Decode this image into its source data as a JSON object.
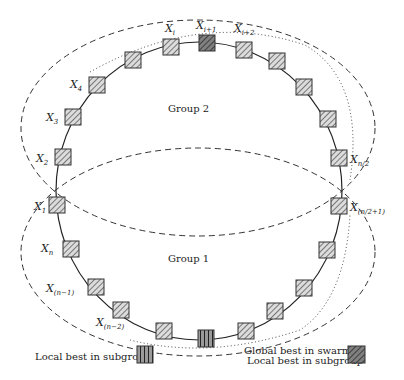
{
  "diagram": {
    "type": "ring-topology-swarm",
    "groups": [
      {
        "id": "group-2",
        "label": "Group 2"
      },
      {
        "id": "group-1",
        "label": "Group 1"
      }
    ],
    "node_labels": {
      "x_i": {
        "base": "X",
        "sub": "i"
      },
      "x_i1": {
        "base": "X",
        "sub": "i+1"
      },
      "x_i2": {
        "base": "X",
        "sub": "i+2"
      },
      "x_4": {
        "base": "X",
        "sub": "4"
      },
      "x_3": {
        "base": "X",
        "sub": "3"
      },
      "x_2": {
        "base": "X",
        "sub": "2"
      },
      "x_1": {
        "base": "X",
        "sub": "1"
      },
      "x_n": {
        "base": "X",
        "sub": "n"
      },
      "x_n1": {
        "base": "X",
        "sub": "(n−1)"
      },
      "x_n2": {
        "base": "X",
        "sub": "(n−2)"
      },
      "x_half": {
        "base": "X",
        "sub": "n/2"
      },
      "x_half1": {
        "base": "X",
        "sub": "(n/2+1)"
      }
    },
    "legend": {
      "left": {
        "label": "Local best in subgroup",
        "pattern": "vertical-stripes"
      },
      "right": {
        "line1": "Global best in swarm",
        "line2": "Local best in subgroup",
        "pattern": "dark-diagonal-hatch"
      }
    },
    "colors": {
      "line": "#222222",
      "node_fill": "#d8d8d8",
      "dark_node_fill": "#7a7a7a",
      "stripe_fill": "#9a9a9a"
    }
  }
}
